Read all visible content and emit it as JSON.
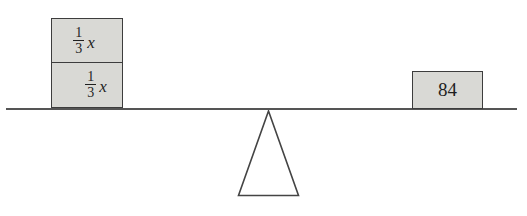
{
  "diagram": {
    "type": "balance-scale",
    "left_stack": {
      "blocks": [
        {
          "numerator": "1",
          "denominator": "3",
          "variable": "x"
        },
        {
          "numerator": "1",
          "denominator": "3",
          "variable": "x"
        }
      ]
    },
    "right_block": {
      "value": "84"
    },
    "colors": {
      "block_fill": "#d9d9d5",
      "block_border": "#3d3d3d",
      "beam": "#555555",
      "text": "#1f1f1f",
      "background": "#ffffff"
    }
  }
}
